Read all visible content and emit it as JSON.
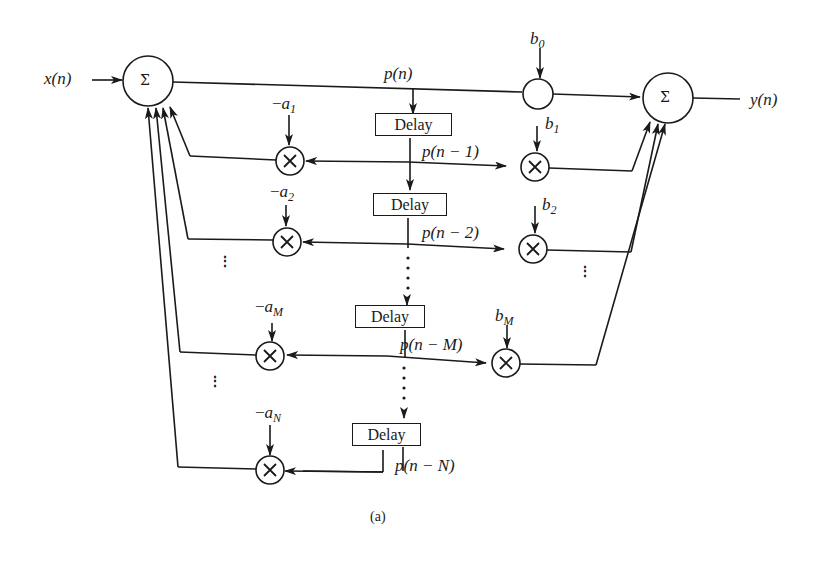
{
  "diagram": {
    "type": "signal-flow",
    "caption": "(a)",
    "input_label": "x(n)",
    "output_label": "y(n)",
    "adder_symbol": "Σ",
    "multiplier_symbol": "×",
    "delay_label": "Delay",
    "center_signal": "p(n)",
    "delayed_signals": [
      "p(n − 1)",
      "p(n − 2)",
      "p(n − M)",
      "p(n − N)"
    ],
    "feedback_coeffs": [
      "−a1",
      "−a2",
      "−aM",
      "−aN"
    ],
    "feedforward_coeffs": [
      "b0",
      "b1",
      "b2",
      "bM"
    ],
    "ellipsis": "⋮"
  }
}
